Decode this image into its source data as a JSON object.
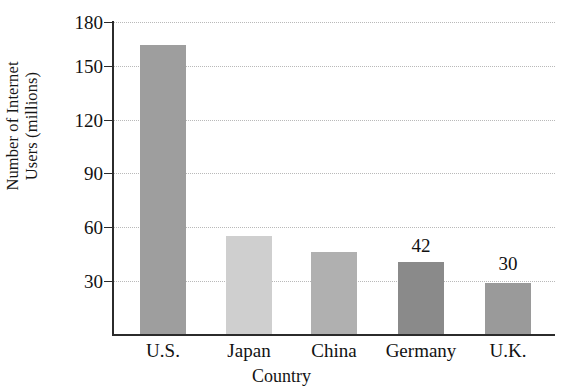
{
  "chart_data": {
    "type": "bar",
    "title": "",
    "xlabel": "Country",
    "ylabel": "Number of Internet Users (millions)",
    "ylabel_line1": "Number of Internet",
    "ylabel_line2": "Users (millions)",
    "categories": [
      "U.S.",
      "Japan",
      "China",
      "Germany",
      "U.K."
    ],
    "values": [
      167,
      57,
      48,
      42,
      30
    ],
    "point_labels": [
      "",
      "",
      "",
      "42",
      "30"
    ],
    "bar_colors": [
      "#9e9e9e",
      "#cfcfcf",
      "#b0b0b0",
      "#8a8a8a",
      "#9a9a9a"
    ],
    "yticks": [
      30,
      60,
      90,
      120,
      150,
      180
    ],
    "ytick_labels": [
      "30",
      "60",
      "90",
      "120",
      "150",
      "180"
    ],
    "ylim": [
      0,
      180
    ],
    "grid": "horizontal-dotted",
    "legend": "none",
    "axis_color": "#2b2b2b",
    "grid_color": "#b9b9b9",
    "background": "#ffffff"
  },
  "axis": {
    "y_title_line1": "Number of Internet",
    "y_title_line2": "Users (millions)",
    "x_title": "Country"
  },
  "yticks": {
    "t0": "30",
    "t1": "60",
    "t2": "90",
    "t3": "120",
    "t4": "150",
    "t5": "180"
  },
  "categories": {
    "c0": "U.S.",
    "c1": "Japan",
    "c2": "China",
    "c3": "Germany",
    "c4": "U.K."
  },
  "values": {
    "v3": "42",
    "v4": "30"
  }
}
